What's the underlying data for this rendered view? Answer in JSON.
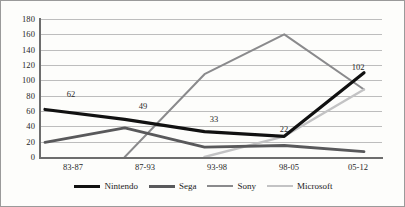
{
  "chart_data": {
    "type": "line",
    "title": "",
    "subtitle": "",
    "xlabel": "",
    "ylabel": "",
    "categories": [
      "83-87",
      "87-93",
      "93-98",
      "98-05",
      "05-12"
    ],
    "ylim": [
      0,
      180
    ],
    "yticks": [
      0,
      20,
      40,
      60,
      80,
      100,
      120,
      140,
      160,
      180
    ],
    "grid": true,
    "legend_position": "bottom",
    "series": [
      {
        "name": "Nintendo",
        "color": "#111111",
        "values": [
          62,
          49,
          33,
          27,
          110
        ]
      },
      {
        "name": "Sega",
        "color": "#59595b",
        "values": [
          19,
          38,
          13,
          15,
          7
        ]
      },
      {
        "name": "Sony",
        "color": "#8a8a8c",
        "values": [
          null,
          0,
          108,
          160,
          88
        ]
      },
      {
        "name": "Microsoft",
        "color": "#c3c3c4",
        "values": [
          null,
          null,
          0,
          27,
          88
        ]
      }
    ],
    "annotations": [
      {
        "text": "62",
        "series": "Nintendo",
        "category": "83-87",
        "value": 62
      },
      {
        "text": "49",
        "series": "Nintendo",
        "category": "87-93",
        "value": 49
      },
      {
        "text": "33",
        "series": "Nintendo",
        "category": "93-98",
        "value": 33
      },
      {
        "text": "22",
        "series": "Nintendo",
        "category": "98-05",
        "value": 27
      },
      {
        "text": "102",
        "series": "Nintendo",
        "category": "05-12",
        "value": 110
      }
    ]
  },
  "axis": {
    "ytick_labels": [
      "180",
      "160",
      "140",
      "120",
      "100",
      "80",
      "60",
      "40",
      "20",
      "0"
    ],
    "xtick_labels": [
      "83-87",
      "87-93",
      "93-98",
      "98-05",
      "05-12"
    ]
  },
  "legend": {
    "items": [
      {
        "label": "Nintendo"
      },
      {
        "label": "Sega"
      },
      {
        "label": "Sony"
      },
      {
        "label": "Microsoft"
      }
    ]
  }
}
